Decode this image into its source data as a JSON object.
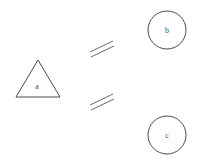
{
  "diagram": {
    "background_color": "#ffffff",
    "stroke_color": "#4a4a4a",
    "tick_color": "#6b6b6b",
    "width": 198,
    "height": 164,
    "nodes": [
      {
        "id": "a",
        "label": "a",
        "shape": "triangle",
        "label_x": 37,
        "label_y": 87,
        "points": "38,60 60,97 16,97"
      },
      {
        "id": "b",
        "label": "b",
        "shape": "circle",
        "cx": 167,
        "cy": 30,
        "r": 19,
        "label_x": 167,
        "label_y": 31
      },
      {
        "id": "c",
        "label": "c",
        "shape": "circle",
        "cx": 167,
        "cy": 135,
        "r": 19,
        "label_x": 167,
        "label_y": 136
      }
    ],
    "relations": [
      {
        "id": "a-b",
        "from": "a",
        "to": "b",
        "mark": "double-slash",
        "line1": {
          "x1": 90,
          "y1": 52,
          "x2": 113,
          "y2": 41
        },
        "line2": {
          "x1": 91,
          "y1": 57,
          "x2": 114,
          "y2": 46
        }
      },
      {
        "id": "a-c",
        "from": "a",
        "to": "c",
        "mark": "double-slash",
        "line1": {
          "x1": 90,
          "y1": 105,
          "x2": 113,
          "y2": 94
        },
        "line2": {
          "x1": 91,
          "y1": 110,
          "x2": 114,
          "y2": 99
        }
      }
    ]
  }
}
